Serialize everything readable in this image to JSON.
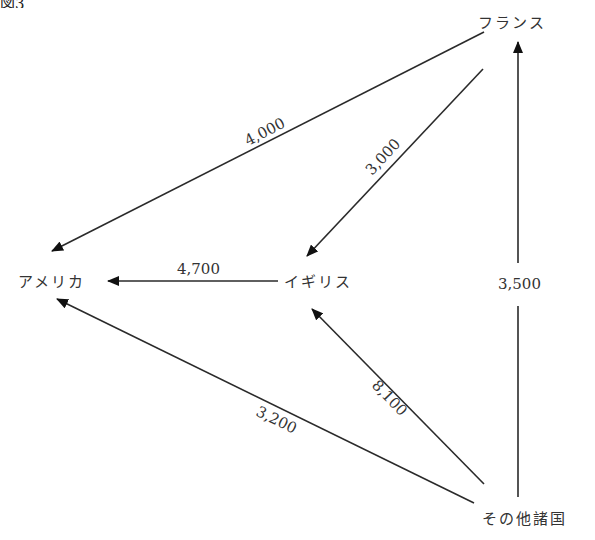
{
  "figure": {
    "title_partial": "図3",
    "nodes": {
      "france": "フランス",
      "usa": "アメリカ",
      "uk": "イギリス",
      "others": "その他諸国"
    },
    "edges": [
      {
        "from": "フランス",
        "to": "アメリカ",
        "value": "4,000"
      },
      {
        "from": "フランス",
        "to": "イギリス",
        "value": "3,000"
      },
      {
        "from": "イギリス",
        "to": "アメリカ",
        "value": "4,700"
      },
      {
        "from": "その他諸国",
        "to": "フランス",
        "value": "3,500"
      },
      {
        "from": "その他諸国",
        "to": "イギリス",
        "value": "8,100"
      },
      {
        "from": "その他諸国",
        "to": "アメリカ",
        "value": "3,200"
      }
    ],
    "colors": {
      "line": "#2a2a2a",
      "text": "#333333",
      "background": "#ffffff"
    }
  }
}
